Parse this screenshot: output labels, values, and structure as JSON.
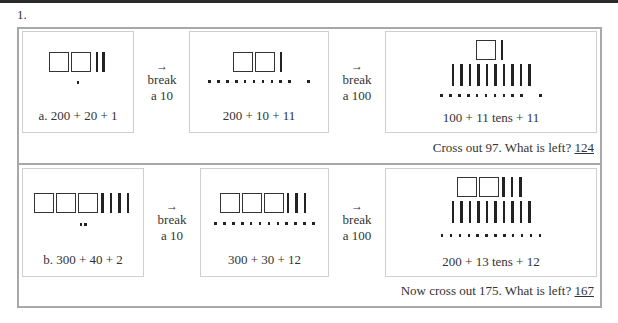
{
  "question_number": "1.",
  "rows": [
    {
      "panels": [
        {
          "caption": "a. 200 + 20 + 1",
          "hundreds": 2,
          "tens": 2,
          "extra_tens": 0,
          "ones": 1
        },
        {
          "caption": "200 + 10 + 11",
          "hundreds": 2,
          "tens": 1,
          "extra_tens": 0,
          "ones": 11
        },
        {
          "caption": "100 + 11 tens + 11",
          "hundreds": 1,
          "tens": 1,
          "extra_tens": 10,
          "ones": 11
        }
      ],
      "arrows": [
        {
          "glyph": "→",
          "line1": "break",
          "line2": "a 10"
        },
        {
          "glyph": "→",
          "line1": "break",
          "line2": "a 100"
        }
      ],
      "question": "Cross out 97. What is left?",
      "answer": "124"
    },
    {
      "panels": [
        {
          "caption": "b. 300 + 40 + 2",
          "hundreds": 3,
          "tens": 4,
          "extra_tens": 0,
          "ones": 2
        },
        {
          "caption": "300 + 30 + 12",
          "hundreds": 3,
          "tens": 3,
          "extra_tens": 0,
          "ones": 12
        },
        {
          "caption": "200 + 13 tens + 12",
          "hundreds": 2,
          "tens": 3,
          "extra_tens": 10,
          "ones": 12
        }
      ],
      "arrows": [
        {
          "glyph": "→",
          "line1": "break",
          "line2": "a 10"
        },
        {
          "glyph": "→",
          "line1": "break",
          "line2": "a 100"
        }
      ],
      "question": "Now cross out 175. What is left?",
      "answer": "167"
    }
  ]
}
